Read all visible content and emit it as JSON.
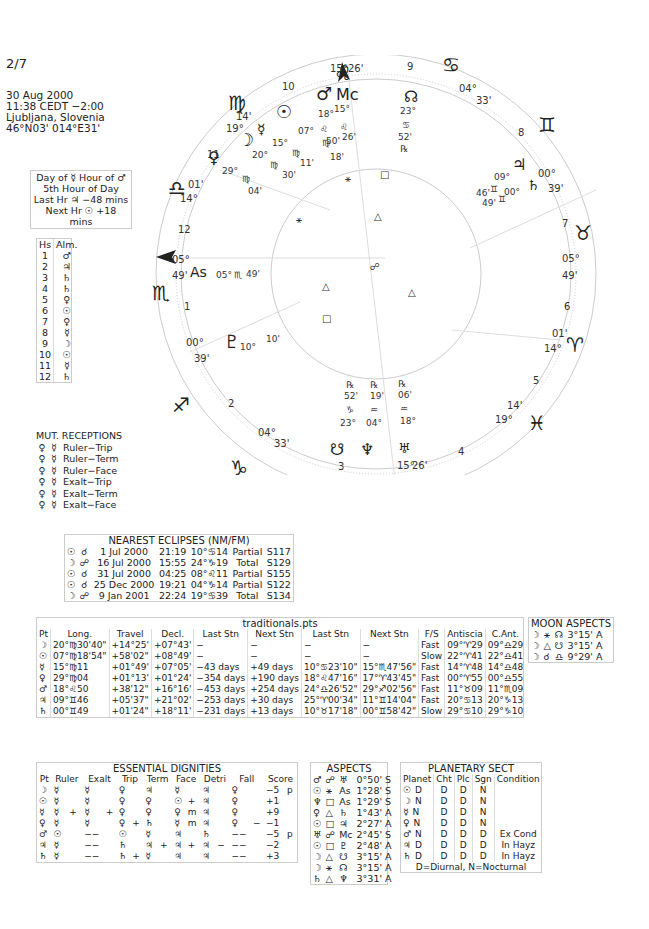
{
  "chart": {
    "number": "2/7",
    "date": "30 Aug 2000",
    "time": "11:38  CEDT −2:00",
    "place": "Ljubljana, Slovenia",
    "coords": "46°N03' 014°E31'"
  },
  "planetary_hour": {
    "day_label": "Day of ☿  Hour of ♂",
    "hour_label": "5th Hour of Day",
    "last_hr": "Last Hr ♃  −48 mins",
    "next_hr": "Next Hr ☉  +18 mins"
  },
  "almuten": {
    "headers": [
      "Hs",
      "Alm."
    ],
    "rows": [
      [
        "1",
        "♂"
      ],
      [
        "2",
        "♃"
      ],
      [
        "3",
        "♄"
      ],
      [
        "4",
        "♄"
      ],
      [
        "5",
        "♀"
      ],
      [
        "6",
        "☉"
      ],
      [
        "7",
        "♀"
      ],
      [
        "8",
        "☿"
      ],
      [
        "9",
        "☽"
      ],
      [
        "10",
        "☉"
      ],
      [
        "11",
        "☿"
      ],
      [
        "12",
        "♄"
      ]
    ]
  },
  "mutual_receptions": {
    "title": "MUT. RECEPTIONS",
    "rows": [
      [
        "♀",
        "☿",
        "Ruler−Trip"
      ],
      [
        "♀",
        "☿",
        "Ruler−Term"
      ],
      [
        "♀",
        "☿",
        "Ruler−Face"
      ],
      [
        "♀",
        "☿",
        "Exalt−Trip"
      ],
      [
        "♀",
        "☿",
        "Exalt−Term"
      ],
      [
        "♀",
        "☿",
        "Exalt−Face"
      ]
    ]
  },
  "eclipses": {
    "title": "NEAREST ECLIPSES (NM/FM)",
    "rows": [
      [
        "☉",
        "☌",
        "1 Jul 2000",
        "21:19",
        "10°♋14",
        "Partial",
        "S117"
      ],
      [
        "☽",
        "☍",
        "16 Jul 2000",
        "15:55",
        "24°♑19",
        "Total",
        "S129"
      ],
      [
        "☉",
        "☌",
        "31 Jul 2000",
        "04:25",
        "08°♌11",
        "Partial",
        "S155"
      ],
      [
        "☉",
        "☌",
        "25 Dec 2000",
        "19:21",
        "04°♑14",
        "Partial",
        "S122"
      ],
      [
        "☽",
        "☍",
        "9 Jan 2001",
        "22:24",
        "19°♋39",
        "Total",
        "S134"
      ]
    ]
  },
  "traditionals": {
    "title": "traditionals.pts",
    "headers": [
      "Pt",
      "Long.",
      "Travel",
      "Decl.",
      "Last Stn",
      "Next Stn",
      "Last Stn",
      "Next Stn",
      "F/S",
      "Antiscia",
      "C.Ant."
    ],
    "rows": [
      [
        "☽",
        "20°♍30'40\"",
        "+14°25'",
        "+07°43'",
        "−",
        "−",
        "−",
        "−",
        "Fast",
        "09°♈29",
        "09°♎29"
      ],
      [
        "☉",
        "07°♍18'54\"",
        "+58'02\"",
        "+08°49'",
        "−",
        "−",
        "−",
        "−",
        "Slow",
        "22°♈41",
        "22°♎41"
      ],
      [
        "☿",
        "15°♍11",
        "+01°49'",
        "+07°05'",
        "−43 days",
        "+49 days",
        "10°♋23'10\"",
        "15°♏47'56\"",
        "Fast",
        "14°♈48",
        "14°♎48"
      ],
      [
        "♀",
        "29°♍04",
        "+01°13'",
        "+01°24'",
        "−354 days",
        "+190 days",
        "18°♌47'16\"",
        "17°♈43'45\"",
        "Fast",
        "00°♈55",
        "00°♎55"
      ],
      [
        "♂",
        "18°♌50",
        "+38'12\"",
        "+16°16'",
        "−453 days",
        "+254 days",
        "24°♎26'52\"",
        "29°♐02'56\"",
        "Fast",
        "11°♉09",
        "11°♏09"
      ],
      [
        "♃",
        "09°♊46",
        "+05'37\"",
        "+21°02'",
        "−253 days",
        "+30 days",
        "25°♈00'34\"",
        "11°♊14'04\"",
        "Fast",
        "20°♋13",
        "20°♑13"
      ],
      [
        "♄",
        "00°♊49",
        "+01'24\"",
        "+18°11'",
        "−231 days",
        "+13 days",
        "10°♉17'18\"",
        "00°♊58'42\"",
        "Slow",
        "29°♋10",
        "29°♑10"
      ]
    ]
  },
  "moon_aspects": {
    "title": "MOON ASPECTS",
    "rows": [
      [
        "☽",
        "⚹",
        "☊",
        "3°15' A"
      ],
      [
        "☽",
        "△",
        "☋",
        "3°15' A"
      ],
      [
        "☽",
        "☌",
        "♎",
        "9°29' A"
      ]
    ]
  },
  "dignities": {
    "title": "ESSENTIAL DIGNITIES",
    "headers": [
      "Pt",
      "Ruler",
      "",
      "Exalt",
      "",
      "Trip",
      "",
      "Term",
      "",
      "Face",
      "",
      "Detri",
      "",
      "Fall",
      "",
      "Score",
      ""
    ],
    "rows": [
      [
        "☽",
        "☿",
        "",
        "☿",
        "",
        "♀",
        "",
        "♃",
        "",
        "☿",
        "",
        "♃",
        "",
        "♀",
        "",
        "−5",
        "p"
      ],
      [
        "☉",
        "☿",
        "",
        "☿",
        "",
        "♀",
        "",
        "♀",
        "",
        "☉",
        "+",
        "♃",
        "",
        "♀",
        "",
        "+1",
        ""
      ],
      [
        "☿",
        "☿",
        "+",
        "☿",
        "+",
        "♀",
        "",
        "♀",
        "",
        "♀",
        "m",
        "♃",
        "",
        "♀",
        "",
        "+9",
        ""
      ],
      [
        "♀",
        "☿",
        "",
        "☿",
        "",
        "♀",
        "+",
        "♄",
        "",
        "☿",
        "m",
        "♃",
        "",
        "♀",
        "−",
        "−1",
        ""
      ],
      [
        "♂",
        "☉",
        "",
        "−−",
        "",
        "☉",
        "",
        "☿",
        "",
        "♃",
        "",
        "♄",
        "",
        "−−",
        "",
        "−5",
        "p"
      ],
      [
        "♃",
        "☿",
        "",
        "−−",
        "",
        "♄",
        "",
        "♃",
        "+",
        "♃",
        "+",
        "♃",
        "−",
        "−−",
        "",
        "−2",
        ""
      ],
      [
        "♄",
        "☿",
        "",
        "−−",
        "",
        "♄",
        "+",
        "☿",
        "",
        "♃",
        "",
        "♃",
        "",
        "−−",
        "",
        "+3",
        ""
      ]
    ]
  },
  "aspects": {
    "title": "ASPECTS",
    "rows": [
      [
        "♂",
        "☍",
        "♅",
        "0°50' S"
      ],
      [
        "☉",
        "⚹",
        "As",
        "1°28' S"
      ],
      [
        "♆",
        "□",
        "As",
        "1°29' S"
      ],
      [
        "♀",
        "△",
        "♄",
        "1°43' A"
      ],
      [
        "☉",
        "□",
        "♃",
        "2°27' A"
      ],
      [
        "♅",
        "☍",
        "Mc",
        "2°45' S"
      ],
      [
        "☉",
        "□",
        "♇",
        "2°48' A"
      ],
      [
        "☽",
        "△",
        "☋",
        "3°15' A"
      ],
      [
        "☽",
        "⚹",
        "☊",
        "3°15' A"
      ],
      [
        "♄",
        "△",
        "♆",
        "3°31' A"
      ]
    ]
  },
  "sect": {
    "title": "PLANETARY SECT",
    "headers": [
      "Planet",
      "Cht",
      "Plc",
      "Sgn",
      "Condition"
    ],
    "rows": [
      [
        "☉",
        "D",
        "D",
        "D",
        "N",
        ""
      ],
      [
        "☽",
        "N",
        "D",
        "D",
        "N",
        ""
      ],
      [
        "☿",
        "N",
        "D",
        "D",
        "N",
        ""
      ],
      [
        "♀",
        "N",
        "D",
        "D",
        "N",
        ""
      ],
      [
        "♂",
        "N",
        "D",
        "D",
        "D",
        "Ex Cond"
      ],
      [
        "♃",
        "D",
        "D",
        "D",
        "D",
        "In Hayz"
      ],
      [
        "♄",
        "D",
        "D",
        "D",
        "D",
        "In Hayz"
      ]
    ],
    "footer": "D=Diurnal, N=Nocturnal"
  },
  "wheel": {
    "signs": {
      "leo": "♌",
      "cancer": "♋",
      "gemini": "♊",
      "taurus": "♉",
      "aries": "♈",
      "pisces": "♓",
      "aquarius": "♒",
      "capricorn": "♑",
      "sagittarius": "♐",
      "scorpio": "♏",
      "libra": "♎",
      "virgo": "♍"
    },
    "cusps": {
      "mc": "15°♌26'",
      "ic": "15°♒26'",
      "asc": "05°♏49'",
      "dsc": "05°♉49'",
      "c11": "19°♍14'",
      "c12": "14°♎01'",
      "c2": "00°♐39'",
      "c3": "04°♑33'",
      "c5": "19°♓14'",
      "c6": "14°♈01'",
      "c8": "00°♊39'",
      "c9": "04°♋33'"
    },
    "house_numbers": [
      "1",
      "2",
      "3",
      "4",
      "5",
      "6",
      "7",
      "8",
      "9",
      "10",
      "11",
      "12"
    ],
    "planets": [
      {
        "glyph": "☉",
        "deg": "07°",
        "sign": "♍",
        "min": "18'"
      },
      {
        "glyph": "☿",
        "deg": "15°",
        "sign": "♍",
        "min": "11'"
      },
      {
        "glyph": "☽",
        "deg": "20°",
        "sign": "♍",
        "min": "30'"
      },
      {
        "glyph": "♀",
        "deg": "29°",
        "sign": "♍",
        "min": "04'"
      },
      {
        "glyph": "♂",
        "deg": "18°",
        "sign": "♌",
        "min": "50'"
      },
      {
        "glyph": "Mc",
        "deg": "15°",
        "sign": "♌",
        "min": "26'"
      },
      {
        "glyph": "☊",
        "deg": "23°",
        "sign": "♋",
        "min": "52'",
        "retro": "℞"
      },
      {
        "glyph": "♃",
        "deg": "09°",
        "sign": "♊",
        "min": "46'"
      },
      {
        "glyph": "♄",
        "deg": "00°",
        "sign": "♊",
        "min": "49'"
      },
      {
        "glyph": "As",
        "deg": "05°",
        "sign": "♏",
        "min": "49'"
      },
      {
        "glyph": "♇",
        "deg": "10°",
        "sign": "♐",
        "min": "10'"
      },
      {
        "glyph": "☋",
        "deg": "23°",
        "sign": "♑",
        "min": "52'",
        "retro": "℞"
      },
      {
        "glyph": "♆",
        "deg": "04°",
        "sign": "♒",
        "min": "19'",
        "retro": "℞"
      },
      {
        "glyph": "♅",
        "deg": "18°",
        "sign": "♒",
        "min": "06'",
        "retro": "℞"
      }
    ]
  }
}
